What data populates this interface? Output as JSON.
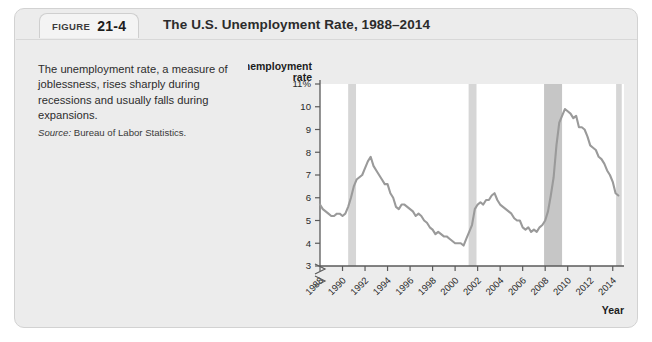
{
  "figure": {
    "badge_word": "FIGURE",
    "badge_number": "21-4",
    "title": "The U.S. Unemployment Rate, 1988–2014"
  },
  "caption": {
    "text": "The unemployment rate, a measure of joblessness, rises sharply during recessions and usually falls during expansions.",
    "source_label": "Source:",
    "source_value": "Bureau of Labor Statistics."
  },
  "colors": {
    "panel_background": "#ececec",
    "plot_background": "#ffffff",
    "line": "#9a9a9a",
    "recession_band_light": "#d6d6d6",
    "recession_band_dark": "#c6c6c6",
    "axis": "#5a5a5a",
    "text": "#2a2a2a"
  },
  "chart_data": {
    "type": "line",
    "title": "The U.S. Unemployment Rate, 1988–2014",
    "xlabel": "Year",
    "ylabel": "Unemployment rate",
    "ylim": [
      3,
      11
    ],
    "ytick_labels": [
      "11%",
      "10",
      "9",
      "8",
      "7",
      "6",
      "5",
      "4",
      "3"
    ],
    "ytick_values": [
      11,
      10,
      9,
      8,
      7,
      6,
      5,
      4,
      3
    ],
    "axis_break": true,
    "xlim": [
      1988,
      2015
    ],
    "xtick_labels": [
      "1988",
      "1990",
      "1992",
      "1994",
      "1996",
      "1998",
      "2000",
      "2002",
      "2004",
      "2006",
      "2008",
      "2010",
      "2012",
      "2014"
    ],
    "xtick_values": [
      1988,
      1990,
      1992,
      1994,
      1996,
      1998,
      2000,
      2002,
      2004,
      2006,
      2008,
      2010,
      2012,
      2014
    ],
    "grid": false,
    "legend": false,
    "recessions": [
      {
        "label": "1990-91 recession",
        "start": 1990.5,
        "end": 1991.2,
        "shade": "light"
      },
      {
        "label": "2001 recession",
        "start": 2001.2,
        "end": 2001.9,
        "shade": "light"
      },
      {
        "label": "2007-09 recession",
        "start": 2007.9,
        "end": 2009.5,
        "shade": "dark"
      },
      {
        "label": "edge band",
        "start": 2014.3,
        "end": 2014.8,
        "shade": "light"
      }
    ],
    "series": [
      {
        "name": "Unemployment rate",
        "x": [
          1988.0,
          1988.25,
          1988.5,
          1988.75,
          1989.0,
          1989.25,
          1989.5,
          1989.75,
          1990.0,
          1990.25,
          1990.5,
          1990.75,
          1991.0,
          1991.25,
          1991.5,
          1991.75,
          1992.0,
          1992.25,
          1992.5,
          1992.75,
          1993.0,
          1993.25,
          1993.5,
          1993.75,
          1994.0,
          1994.25,
          1994.5,
          1994.75,
          1995.0,
          1995.25,
          1995.5,
          1995.75,
          1996.0,
          1996.25,
          1996.5,
          1996.75,
          1997.0,
          1997.25,
          1997.5,
          1997.75,
          1998.0,
          1998.25,
          1998.5,
          1998.75,
          1999.0,
          1999.25,
          1999.5,
          1999.75,
          2000.0,
          2000.25,
          2000.5,
          2000.75,
          2001.0,
          2001.25,
          2001.5,
          2001.75,
          2002.0,
          2002.25,
          2002.5,
          2002.75,
          2003.0,
          2003.25,
          2003.5,
          2003.75,
          2004.0,
          2004.25,
          2004.5,
          2004.75,
          2005.0,
          2005.25,
          2005.5,
          2005.75,
          2006.0,
          2006.25,
          2006.5,
          2006.75,
          2007.0,
          2007.25,
          2007.5,
          2007.75,
          2008.0,
          2008.25,
          2008.5,
          2008.75,
          2009.0,
          2009.25,
          2009.5,
          2009.75,
          2010.0,
          2010.25,
          2010.5,
          2010.75,
          2011.0,
          2011.25,
          2011.5,
          2011.75,
          2012.0,
          2012.25,
          2012.5,
          2012.75,
          2013.0,
          2013.25,
          2013.5,
          2013.75,
          2014.0,
          2014.25,
          2014.5
        ],
        "values": [
          5.7,
          5.5,
          5.4,
          5.3,
          5.2,
          5.2,
          5.3,
          5.3,
          5.2,
          5.3,
          5.6,
          6.0,
          6.5,
          6.8,
          6.9,
          7.0,
          7.3,
          7.6,
          7.8,
          7.4,
          7.2,
          7.0,
          6.8,
          6.6,
          6.6,
          6.2,
          6.0,
          5.6,
          5.5,
          5.7,
          5.7,
          5.6,
          5.5,
          5.4,
          5.2,
          5.3,
          5.2,
          5.0,
          4.9,
          4.7,
          4.6,
          4.4,
          4.5,
          4.4,
          4.3,
          4.3,
          4.2,
          4.1,
          4.0,
          4.0,
          4.0,
          3.9,
          4.2,
          4.5,
          4.8,
          5.5,
          5.7,
          5.8,
          5.7,
          5.9,
          5.9,
          6.1,
          6.2,
          5.9,
          5.7,
          5.6,
          5.5,
          5.4,
          5.3,
          5.1,
          5.0,
          5.0,
          4.7,
          4.6,
          4.7,
          4.5,
          4.6,
          4.5,
          4.7,
          4.8,
          5.0,
          5.4,
          6.1,
          6.9,
          8.3,
          9.3,
          9.6,
          9.9,
          9.8,
          9.7,
          9.5,
          9.6,
          9.1,
          9.1,
          9.0,
          8.7,
          8.3,
          8.2,
          8.1,
          7.8,
          7.7,
          7.5,
          7.2,
          7.0,
          6.7,
          6.2,
          6.1
        ]
      }
    ]
  }
}
